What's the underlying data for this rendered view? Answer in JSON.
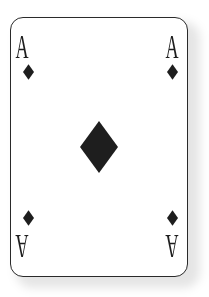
{
  "card": {
    "rank": "A",
    "suit": "diamonds",
    "suit_icon": "diamond-icon",
    "ink_color": "#1e1e1e",
    "border_color": "#2a2a2a",
    "face_color": "#ffffff"
  },
  "corners": {
    "top_left": {
      "rank": "A"
    },
    "top_right": {
      "rank": "A"
    },
    "bottom_left": {
      "rank": "A"
    },
    "bottom_right": {
      "rank": "A"
    }
  }
}
